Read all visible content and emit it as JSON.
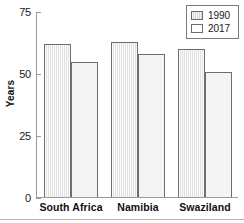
{
  "chart_data": {
    "type": "bar",
    "title": "",
    "xlabel": "",
    "ylabel": "Years",
    "ylim": [
      0,
      75
    ],
    "yticks": [
      0,
      25,
      50,
      75
    ],
    "ytick_labels": [
      "0",
      "25",
      "50",
      "75"
    ],
    "grid": false,
    "legend_position": "top-right",
    "categories": [
      "South Africa",
      "Namibia",
      "Swaziland"
    ],
    "series": [
      {
        "name": "1990",
        "color": "#e2e2e2",
        "values": [
          62,
          63,
          60
        ]
      },
      {
        "name": "2017",
        "color": "#f4f4f4",
        "values": [
          55,
          58,
          51
        ]
      }
    ]
  },
  "legend": {
    "entries": [
      {
        "label": "1990"
      },
      {
        "label": "2017"
      }
    ]
  },
  "axis": {
    "y_title": "Years",
    "y_labels": [
      "75",
      "50",
      "25",
      "0"
    ]
  },
  "categories": {
    "0": "South Africa",
    "1": "Namibia",
    "2": "Swaziland"
  }
}
